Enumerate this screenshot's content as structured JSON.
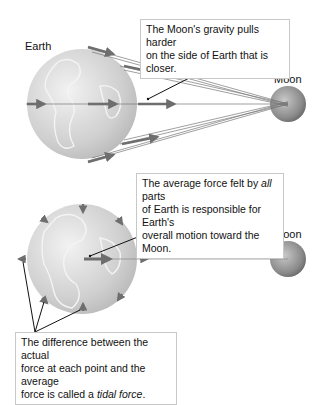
{
  "labels": {
    "earth": "Earth",
    "moon_top": "Moon",
    "moon_bottom": "Moon"
  },
  "callouts": {
    "top": {
      "line1": "The Moon's gravity pulls harder",
      "line2": "on the side of Earth that is closer."
    },
    "middle": {
      "line1_pre": "The average force felt by ",
      "line1_em": "all",
      "line1_post": " parts",
      "line2": "of Earth is responsible for Earth's",
      "line3": "overall motion toward the Moon."
    },
    "bottom": {
      "line1": "The difference between the actual",
      "line2": "force at each point and the average",
      "line3_pre": "force is called a ",
      "line3_em": "tidal force",
      "line3_post": "."
    }
  },
  "colors": {
    "arrow": "#6e6e6e",
    "earth": "#d4d4d4",
    "moon": "#8a8a8a"
  }
}
